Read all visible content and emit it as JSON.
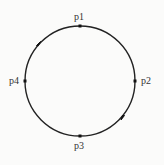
{
  "diagram": {
    "type": "circle-with-points",
    "stroke_color": "#222222",
    "background": "#fbfbfa",
    "circle": {
      "cx": 80,
      "cy": 81,
      "r": 55
    },
    "points": [
      {
        "id": "p1",
        "label": "p1",
        "position": "top"
      },
      {
        "id": "p2",
        "label": "p2",
        "position": "right"
      },
      {
        "id": "p3",
        "label": "p3",
        "position": "bottom"
      },
      {
        "id": "p4",
        "label": "p4",
        "position": "left"
      }
    ],
    "arrows": [
      {
        "location": "between p4 and p1",
        "direction": "clockwise"
      },
      {
        "location": "between p2 and p3",
        "direction": "clockwise"
      }
    ]
  }
}
